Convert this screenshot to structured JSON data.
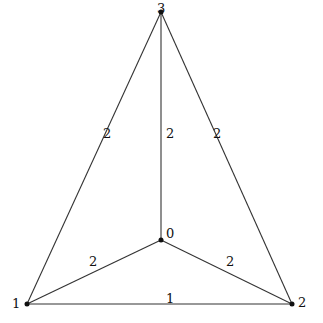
{
  "graph": {
    "nodes": [
      {
        "id": "0",
        "label": "0",
        "x": 161,
        "y": 240,
        "label_x": 166,
        "label_y": 238
      },
      {
        "id": "1",
        "label": "1",
        "x": 27,
        "y": 304,
        "label_x": 12,
        "label_y": 308
      },
      {
        "id": "2",
        "label": "2",
        "x": 292,
        "y": 304,
        "label_x": 298,
        "label_y": 307
      },
      {
        "id": "3",
        "label": "3",
        "x": 161,
        "y": 12,
        "label_x": 157,
        "label_y": 13
      }
    ],
    "edges": [
      {
        "from": "1",
        "to": "3",
        "weight": "2",
        "label_x": 103,
        "label_y": 138
      },
      {
        "from": "0",
        "to": "3",
        "weight": "2",
        "label_x": 166,
        "label_y": 138
      },
      {
        "from": "2",
        "to": "3",
        "weight": "2",
        "label_x": 213,
        "label_y": 138
      },
      {
        "from": "0",
        "to": "1",
        "weight": "2",
        "label_x": 89,
        "label_y": 266
      },
      {
        "from": "0",
        "to": "2",
        "weight": "2",
        "label_x": 226,
        "label_y": 266
      },
      {
        "from": "1",
        "to": "2",
        "weight": "1",
        "label_x": 166,
        "label_y": 303
      }
    ]
  }
}
